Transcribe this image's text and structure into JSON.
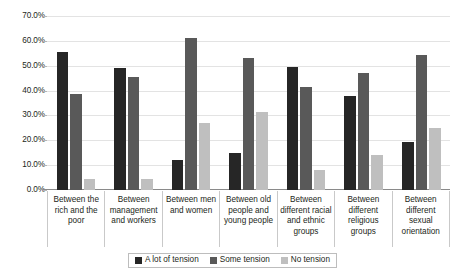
{
  "chart_data": {
    "type": "bar",
    "title": "",
    "xlabel": "",
    "ylabel": "",
    "ylim": [
      0,
      70
    ],
    "ytick_labels": [
      "0.0%",
      "10.0%",
      "20.0%",
      "30.0%",
      "40.0%",
      "50.0%",
      "60.0%",
      "70.0%"
    ],
    "ytick_values": [
      0,
      10,
      20,
      30,
      40,
      50,
      60,
      70
    ],
    "grid": true,
    "legend_position": "bottom",
    "categories": [
      "Between the rich and the poor",
      "Between management and workers",
      "Between men and women",
      "Between old people and young people",
      "Between different racial and ethnic groups",
      "Between different religious groups",
      "Between different sexual orientation"
    ],
    "series": [
      {
        "name": "A lot of tension",
        "color": "#262626",
        "values": [
          55.5,
          49.0,
          12.0,
          15.0,
          49.5,
          38.0,
          19.5
        ]
      },
      {
        "name": "Some tension",
        "color": "#595959",
        "values": [
          38.5,
          45.5,
          61.0,
          53.0,
          41.5,
          47.0,
          54.5
        ]
      },
      {
        "name": "No tension",
        "color": "#bfbfbf",
        "values": [
          4.5,
          4.5,
          27.0,
          31.5,
          8.0,
          14.0,
          25.0
        ]
      }
    ]
  }
}
